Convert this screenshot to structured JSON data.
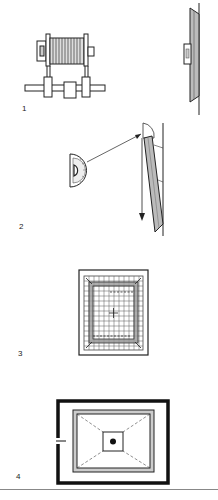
{
  "figure": {
    "panels": [
      {
        "label": "1",
        "subject": "winch-drum-and-wall-mounted-frame"
      },
      {
        "label": "2",
        "subject": "protractor-angle-check-with-plumb-line"
      },
      {
        "label": "3",
        "subject": "gridded-frame-with-center-cross"
      },
      {
        "label": "4",
        "subject": "framed-box-with-center-point"
      }
    ]
  },
  "colors": {
    "ink": "#222222",
    "shade": "#b5b5b5",
    "light_shade": "#d9d9d9",
    "rule": "#888888"
  }
}
